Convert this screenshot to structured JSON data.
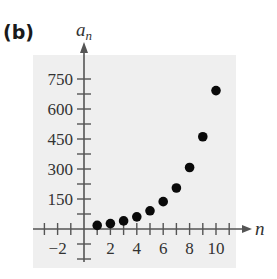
{
  "panel_label": "(b)",
  "chart_data": {
    "type": "scatter",
    "title": "",
    "xlabel": "n",
    "ylabel": "a_n",
    "ylabel_main": "a",
    "ylabel_sub": "n",
    "x": [
      1,
      2,
      3,
      4,
      5,
      6,
      7,
      8,
      9,
      10
    ],
    "series": [
      {
        "name": "a_n",
        "values": [
          18,
          27,
          40.5,
          60.75,
          91.1,
          136.7,
          205,
          307.5,
          461.3,
          692
        ]
      }
    ],
    "x_ticks": [
      -2,
      2,
      4,
      6,
      8,
      10
    ],
    "x_tick_labels": [
      "−2",
      "2",
      "4",
      "6",
      "8",
      "10"
    ],
    "y_ticks": [
      150,
      300,
      450,
      600,
      750
    ],
    "y_tick_labels": [
      "150",
      "300",
      "450",
      "600",
      "750"
    ],
    "xlim": [
      -3,
      11
    ],
    "ylim": [
      -150,
      800
    ],
    "grid": false,
    "legend": "none",
    "colors": {
      "background": "#efefef",
      "axis": "#555555",
      "point": "#0a0a0a"
    }
  }
}
